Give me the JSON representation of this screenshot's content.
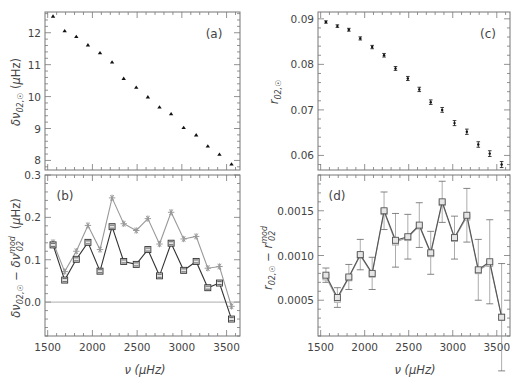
{
  "chart_data": [
    {
      "panel": "(a)",
      "type": "scatter",
      "title": "",
      "xlabel": "",
      "ylabel": "δν02,☉ (μHz)",
      "xlim": [
        1470,
        3650
      ],
      "ylim": [
        7.7,
        12.65
      ],
      "yticks": [
        8,
        9,
        10,
        11,
        12
      ],
      "ytick_labels": [
        "8",
        "9",
        "10",
        "11",
        "12"
      ],
      "grid": false,
      "marker": "triangle",
      "color": "#000000",
      "x": [
        1560,
        1690,
        1820,
        1950,
        2085,
        2220,
        2350,
        2490,
        2620,
        2750,
        2880,
        3020,
        3160,
        3290,
        3420,
        3555
      ],
      "y": [
        12.52,
        12.06,
        11.88,
        11.62,
        11.37,
        11.08,
        10.57,
        10.29,
        9.99,
        9.67,
        9.46,
        9.03,
        8.8,
        8.45,
        8.19,
        7.89
      ]
    },
    {
      "panel": "(b)",
      "type": "line",
      "title": "",
      "xlabel": "ν (μHz)",
      "ylabel": "δν02,☉ − δν02^mod (μHz)",
      "xlim": [
        1470,
        3650
      ],
      "ylim": [
        -0.08,
        0.3
      ],
      "xticks": [
        1500,
        2000,
        2500,
        3000,
        3500
      ],
      "xtick_labels": [
        "1500",
        "2000",
        "2500",
        "3000",
        "3500"
      ],
      "yticks": [
        0.0,
        0.1,
        0.2,
        0.3
      ],
      "ytick_labels": [
        "0.0",
        "0.1",
        "0.2",
        "0.3"
      ],
      "hline": 0.0,
      "grid": false,
      "x": [
        1560,
        1690,
        1820,
        1950,
        2085,
        2220,
        2350,
        2490,
        2620,
        2750,
        2880,
        3020,
        3160,
        3290,
        3420,
        3555
      ],
      "series": [
        {
          "name": "model 1 (squares, dark)",
          "color": "#333333",
          "marker": "square",
          "values": [
            0.135,
            0.052,
            0.101,
            0.141,
            0.073,
            0.178,
            0.096,
            0.089,
            0.124,
            0.062,
            0.139,
            0.075,
            0.096,
            0.034,
            0.045,
            -0.04
          ]
        },
        {
          "name": "model 2 (asterisks, grey)",
          "color": "#999999",
          "marker": "asterisk",
          "values": [
            0.141,
            0.072,
            0.12,
            0.181,
            0.124,
            0.246,
            0.185,
            0.169,
            0.197,
            0.137,
            0.212,
            0.149,
            0.155,
            0.08,
            0.084,
            -0.01
          ]
        }
      ]
    },
    {
      "panel": "(c)",
      "type": "scatter",
      "title": "",
      "xlabel": "",
      "ylabel": "r02,☉",
      "xlim": [
        1470,
        3650
      ],
      "ylim": [
        0.0568,
        0.0915
      ],
      "yticks": [
        0.06,
        0.07,
        0.08,
        0.09
      ],
      "ytick_labels": [
        "0.06",
        "0.07",
        "0.08",
        "0.09"
      ],
      "grid": false,
      "marker": "dot-errorbar",
      "color": "#000000",
      "x": [
        1560,
        1690,
        1820,
        1950,
        2085,
        2220,
        2350,
        2490,
        2620,
        2750,
        2880,
        3020,
        3160,
        3290,
        3420,
        3555
      ],
      "y": [
        0.0893,
        0.0884,
        0.0876,
        0.0857,
        0.0838,
        0.082,
        0.0791,
        0.0769,
        0.0745,
        0.0717,
        0.07,
        0.0671,
        0.0652,
        0.0624,
        0.0604,
        0.058
      ]
    },
    {
      "panel": "(d)",
      "type": "line",
      "title": "",
      "xlabel": "ν (μHz)",
      "ylabel": "r02,☉ − r02^mod",
      "xlim": [
        1470,
        3650
      ],
      "ylim": [
        0.0001,
        0.0019
      ],
      "xticks": [
        1500,
        2000,
        2500,
        3000,
        3500
      ],
      "xtick_labels": [
        "1500",
        "2000",
        "2500",
        "3000",
        "3500"
      ],
      "yticks": [
        0.0005,
        0.001,
        0.0015
      ],
      "ytick_labels": [
        "0.0005",
        "0.0010",
        "0.0015"
      ],
      "grid": false,
      "x": [
        1560,
        1690,
        1820,
        1950,
        2085,
        2220,
        2350,
        2490,
        2620,
        2750,
        2880,
        3020,
        3160,
        3290,
        3420,
        3555
      ],
      "errors": [
        8e-05,
        0.00011,
        0.00014,
        0.00017,
        0.00018,
        0.00021,
        0.0003,
        0.00025,
        0.00025,
        0.00024,
        0.00023,
        0.00024,
        0.0003,
        0.00034,
        0.00047,
        0.0006
      ],
      "series": [
        {
          "name": "model 1 (squares, dark)",
          "color": "#555555",
          "marker": "square",
          "values": [
            0.00078,
            0.00053,
            0.00076,
            0.00101,
            0.0008,
            0.0015,
            0.00117,
            0.00121,
            0.00134,
            0.00103,
            0.0016,
            0.0012,
            0.00145,
            0.00084,
            0.00093,
            0.00031
          ]
        },
        {
          "name": "model 2 (squares, light)",
          "color": "#aaaaaa",
          "marker": "square",
          "values": [
            0.00076,
            0.00051,
            0.00075,
            0.001,
            0.00079,
            0.00149,
            0.00115,
            0.0012,
            0.00133,
            0.00102,
            0.00159,
            0.00119,
            0.00143,
            0.00083,
            0.00091,
            0.00031
          ]
        }
      ]
    }
  ],
  "labels": {
    "panel_a": "(a)",
    "panel_b": "(b)",
    "panel_c": "(c)",
    "panel_d": "(d)",
    "xlabel_left": "ν (μHz)",
    "xlabel_right": "ν (μHz)"
  }
}
